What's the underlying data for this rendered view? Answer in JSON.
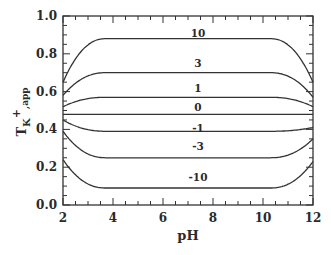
{
  "chart_data": {
    "type": "line",
    "title": "",
    "xlabel": "pH",
    "ylabel": "T_K+,app",
    "ylabel_parts": {
      "main": "T",
      "sub": "K",
      "sup": "+",
      "sub2": ",app"
    },
    "xlim": [
      2,
      12
    ],
    "ylim": [
      0.0,
      1.0
    ],
    "xticks": [
      2,
      4,
      6,
      8,
      10,
      12
    ],
    "xtick_labels": [
      "2",
      "4",
      "6",
      "8",
      "10",
      "12"
    ],
    "x_minor_step": 0.5,
    "yticks": [
      0.0,
      0.2,
      0.4,
      0.6,
      0.8,
      1.0
    ],
    "ytick_labels": [
      "0.0",
      "0.2",
      "0.4",
      "0.6",
      "0.8",
      "1.0"
    ],
    "y_minor_step": 0.05,
    "grid": false,
    "legend": "inline curve labels",
    "series": [
      {
        "name": "10",
        "label_x": 7.4,
        "label_y": 0.91,
        "start": 0.65,
        "plateau": 0.88,
        "end": 0.65,
        "plateau_from": 3.7,
        "plateau_to": 10.3
      },
      {
        "name": "3",
        "label_x": 7.4,
        "label_y": 0.75,
        "start": 0.58,
        "plateau": 0.7,
        "end": 0.57,
        "plateau_from": 3.7,
        "plateau_to": 10.3
      },
      {
        "name": "1",
        "label_x": 7.4,
        "label_y": 0.62,
        "start": 0.52,
        "plateau": 0.57,
        "end": 0.52,
        "plateau_from": 3.7,
        "plateau_to": 10.3
      },
      {
        "name": "0",
        "label_x": 7.4,
        "label_y": 0.52,
        "start": 0.48,
        "plateau": 0.48,
        "end": 0.48,
        "plateau_from": 3.7,
        "plateau_to": 10.3
      },
      {
        "name": "-1",
        "label_x": 7.4,
        "label_y": 0.41,
        "start": 0.45,
        "plateau": 0.39,
        "end": 0.41,
        "plateau_from": 3.7,
        "plateau_to": 10.3
      },
      {
        "name": "-3",
        "label_x": 7.4,
        "label_y": 0.31,
        "start": 0.39,
        "plateau": 0.25,
        "end": 0.35,
        "plateau_from": 3.7,
        "plateau_to": 10.3
      },
      {
        "name": "-10",
        "label_x": 7.4,
        "label_y": 0.15,
        "start": 0.24,
        "plateau": 0.09,
        "end": 0.23,
        "plateau_from": 3.7,
        "plateau_to": 10.3
      }
    ]
  },
  "colors": {
    "line": "#333333",
    "text": "#2a2a2a",
    "background": "#ffffff"
  }
}
